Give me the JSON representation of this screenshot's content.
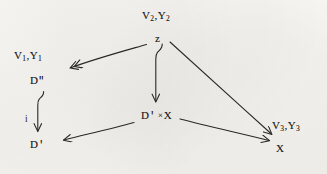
{
  "figure": {
    "kind": "commutative-diagram",
    "background_color": "#f5f4f0",
    "ink_color": "#272420",
    "width": 327,
    "height": 174
  },
  "nodes": {
    "v2y2": {
      "id": "v2y2",
      "label": "V2,Y2",
      "base1": "V",
      "sub1": "2",
      "sep": ",",
      "base2": "Y",
      "sub2": "2",
      "x": 142,
      "y": 10
    },
    "z": {
      "id": "z",
      "label": "z",
      "x": 155,
      "y": 33
    },
    "v1y1": {
      "id": "v1y1",
      "label": "V1,Y1",
      "base1": "V",
      "sub1": "1",
      "sep": ",",
      "base2": "Y",
      "sub2": "1",
      "x": 14,
      "y": 50
    },
    "dprimeprime": {
      "id": "dprimeprime",
      "label": "D\"",
      "base": "D",
      "mark": "\"",
      "x": 30,
      "y": 75
    },
    "dprime": {
      "id": "dprime",
      "label": "D'",
      "base": "D",
      "mark": "'",
      "x": 30,
      "y": 139
    },
    "dprimecrossx": {
      "id": "dprimecrossx",
      "label": "D' ×X",
      "base": "D",
      "mark": "'",
      "times": "×",
      "factor": "X",
      "x": 141,
      "y": 110
    },
    "v3y3": {
      "id": "v3y3",
      "label": "V3,Y3",
      "base1": "V",
      "sub1": "3",
      "sep": ",",
      "base2": "Y",
      "sub2": "3",
      "x": 272,
      "y": 120
    },
    "x": {
      "id": "x",
      "label": "X",
      "x": 276,
      "y": 143
    }
  },
  "arrow_labels": {
    "i": {
      "id": "i",
      "label": "i",
      "x": 25,
      "y": 114
    }
  },
  "arrows": [
    {
      "id": "z-to-v1y1",
      "from": "z",
      "to": "v1y1",
      "head": "double-chevron",
      "tail": "plain",
      "note": "epimorphism arrow pointing down-left"
    },
    {
      "id": "z-to-dprimecrossx",
      "from": "z",
      "to": "dprimecrossx",
      "head": "single",
      "tail": "hooked",
      "note": "vertical arrow with curled tail"
    },
    {
      "id": "z-to-x",
      "from": "z",
      "to": "x",
      "head": "single",
      "tail": "plain",
      "note": "long diagonal to lower right"
    },
    {
      "id": "dprimeprime-to-dprime",
      "from": "dprimeprime",
      "to": "dprime",
      "head": "single",
      "tail": "hooked",
      "label": "i",
      "note": "vertical inclusion arrow"
    },
    {
      "id": "dprimecrossx-to-dprime",
      "from": "dprimecrossx",
      "to": "dprime",
      "head": "single",
      "tail": "plain",
      "note": "projection to lower left"
    },
    {
      "id": "dprimecrossx-to-x",
      "from": "dprimecrossx",
      "to": "x",
      "head": "single",
      "tail": "plain",
      "note": "projection to lower right"
    }
  ]
}
